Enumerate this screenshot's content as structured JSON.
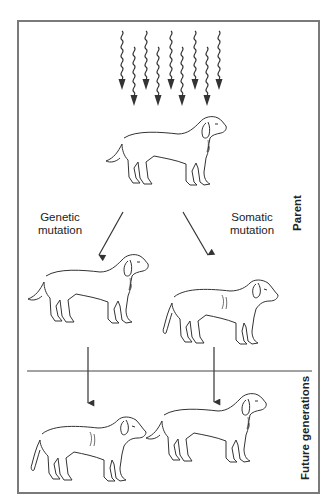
{
  "diagram": {
    "type": "mutation inheritance diagram",
    "stimulus": {
      "icon": "wavy-radiation-arrows",
      "count": 9
    },
    "labels": {
      "genetic": "Genetic\nmutation",
      "genetic_line1": "Genetic",
      "genetic_line2": "mutation",
      "somatic_line1": "Somatic",
      "somatic_line2": "mutation"
    },
    "sections": {
      "parent": "Parent",
      "future": "Future generations"
    },
    "nodes": [
      {
        "id": "parent-dog",
        "label": "Parent",
        "appearance": "normal"
      },
      {
        "id": "child-genetic",
        "via": "Genetic mutation",
        "appearance": "normal"
      },
      {
        "id": "child-somatic",
        "via": "Somatic mutation",
        "appearance": "altered"
      },
      {
        "id": "future-from-genetic",
        "appearance": "altered"
      },
      {
        "id": "future-from-somatic",
        "appearance": "normal"
      }
    ],
    "colors": {
      "frame": "#7a7a7a",
      "ink": "#333333",
      "background": "#ffffff"
    }
  }
}
